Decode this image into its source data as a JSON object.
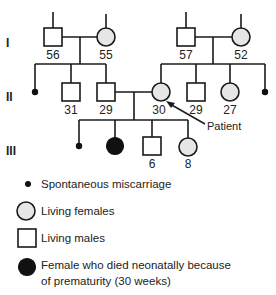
{
  "generations": {
    "I": "I",
    "II": "II",
    "III": "III"
  },
  "individuals": {
    "gen1_male_left": {
      "sex": "male",
      "status": "living",
      "age": "56"
    },
    "gen1_female_left": {
      "sex": "female",
      "status": "living",
      "age": "55"
    },
    "gen1_male_right": {
      "sex": "male",
      "status": "living",
      "age": "57"
    },
    "gen1_female_right": {
      "sex": "female",
      "status": "living",
      "age": "52"
    },
    "gen2_miscarriage_left": {
      "status": "spontaneous miscarriage"
    },
    "gen2_male_31": {
      "sex": "male",
      "status": "living",
      "age": "31"
    },
    "gen2_male_29_husband": {
      "sex": "male",
      "status": "living",
      "age": "29"
    },
    "gen2_female_30_patient": {
      "sex": "female",
      "status": "living",
      "age": "30",
      "proband": true
    },
    "gen2_male_29_right": {
      "sex": "male",
      "status": "living",
      "age": "29"
    },
    "gen2_female_27": {
      "sex": "female",
      "status": "living",
      "age": "27"
    },
    "gen2_miscarriage_right": {
      "status": "spontaneous miscarriage"
    },
    "gen3_miscarriage": {
      "status": "spontaneous miscarriage"
    },
    "gen3_female_neonatal_death": {
      "sex": "female",
      "status": "died neonatally"
    },
    "gen3_male_6": {
      "sex": "male",
      "status": "living",
      "age": "6"
    },
    "gen3_female_8": {
      "sex": "female",
      "status": "living",
      "age": "8"
    }
  },
  "proband_label": "Patient",
  "legend": {
    "miscarriage": "Spontaneous miscarriage",
    "living_females": "Living females",
    "living_males": "Living males",
    "neonatal_death_line1": "Female who died neonatally because",
    "neonatal_death_line2": "of prematurity (30 weeks)"
  },
  "colors": {
    "line": "#1a1a1a",
    "female_fill": "#e6e6e6",
    "male_fill": "#ffffff",
    "deceased_fill": "#111111"
  }
}
